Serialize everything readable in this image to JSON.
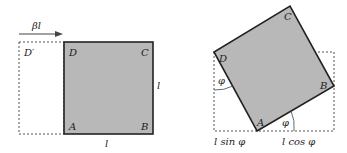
{
  "colors": {
    "fill": "#b8b8b8",
    "stroke": "#222222",
    "dash": "#555555"
  },
  "left_figure": {
    "arrow_label": "βl",
    "corners": {
      "A": "A",
      "B": "B",
      "C": "C",
      "D": "D",
      "D_prime": "D′"
    },
    "side_right_label": "l",
    "side_bottom_label": "l"
  },
  "right_figure": {
    "corners": {
      "A": "A",
      "B": "B",
      "C": "C",
      "D": "D"
    },
    "angle_left_label": "φ",
    "angle_bottom_label": "φ",
    "bottom_left_label": "l sin φ",
    "bottom_right_label": "l cos φ"
  }
}
